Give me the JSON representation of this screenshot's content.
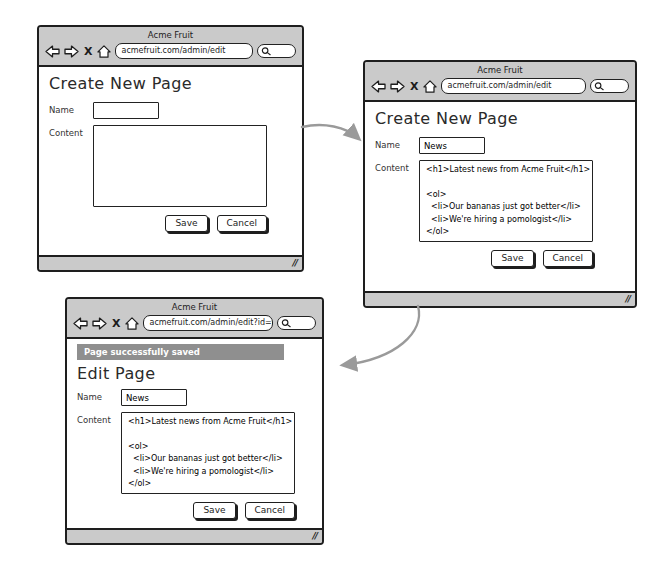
{
  "colors": {
    "chrome_gray": "#cacaca",
    "notification_gray": "#8f8f8f",
    "arrow_gray": "#9a9a9a",
    "border_black": "#1e1e1e"
  },
  "icons": {
    "stop_label": "X",
    "resize_handle": "//"
  },
  "windows": [
    {
      "title": "Acme Fruit",
      "url": "acmefruit.com/admin/edit",
      "heading": "Create New Page",
      "fields": {
        "name_label": "Name",
        "name_value": "",
        "content_label": "Content",
        "content_value": ""
      },
      "buttons": {
        "save": "Save",
        "cancel": "Cancel"
      }
    },
    {
      "title": "Acme Fruit",
      "url": "acmefruit.com/admin/edit",
      "heading": "Create New Page",
      "fields": {
        "name_label": "Name",
        "name_value": "News",
        "content_label": "Content",
        "content_value": "<h1>Latest news from Acme Fruit</h1>\n\n<ol>\n  <li>Our bananas just got better</li>\n  <li>We're hiring a pomologist</li>\n</ol>"
      },
      "buttons": {
        "save": "Save",
        "cancel": "Cancel"
      }
    },
    {
      "title": "Acme Fruit",
      "url": "acmefruit.com/admin/edit?id=6",
      "notification": "Page successfully saved",
      "heading": "Edit Page",
      "fields": {
        "name_label": "Name",
        "name_value": "News",
        "content_label": "Content",
        "content_value": "<h1>Latest news from Acme Fruit</h1>\n\n<ol>\n  <li>Our bananas just got better</li>\n  <li>We're hiring a pomologist</li>\n</ol>"
      },
      "buttons": {
        "save": "Save",
        "cancel": "Cancel"
      }
    }
  ],
  "flow": [
    {
      "from": "create-page-blank",
      "to": "create-page-filled"
    },
    {
      "from": "create-page-filled",
      "to": "edit-page-saved"
    }
  ]
}
